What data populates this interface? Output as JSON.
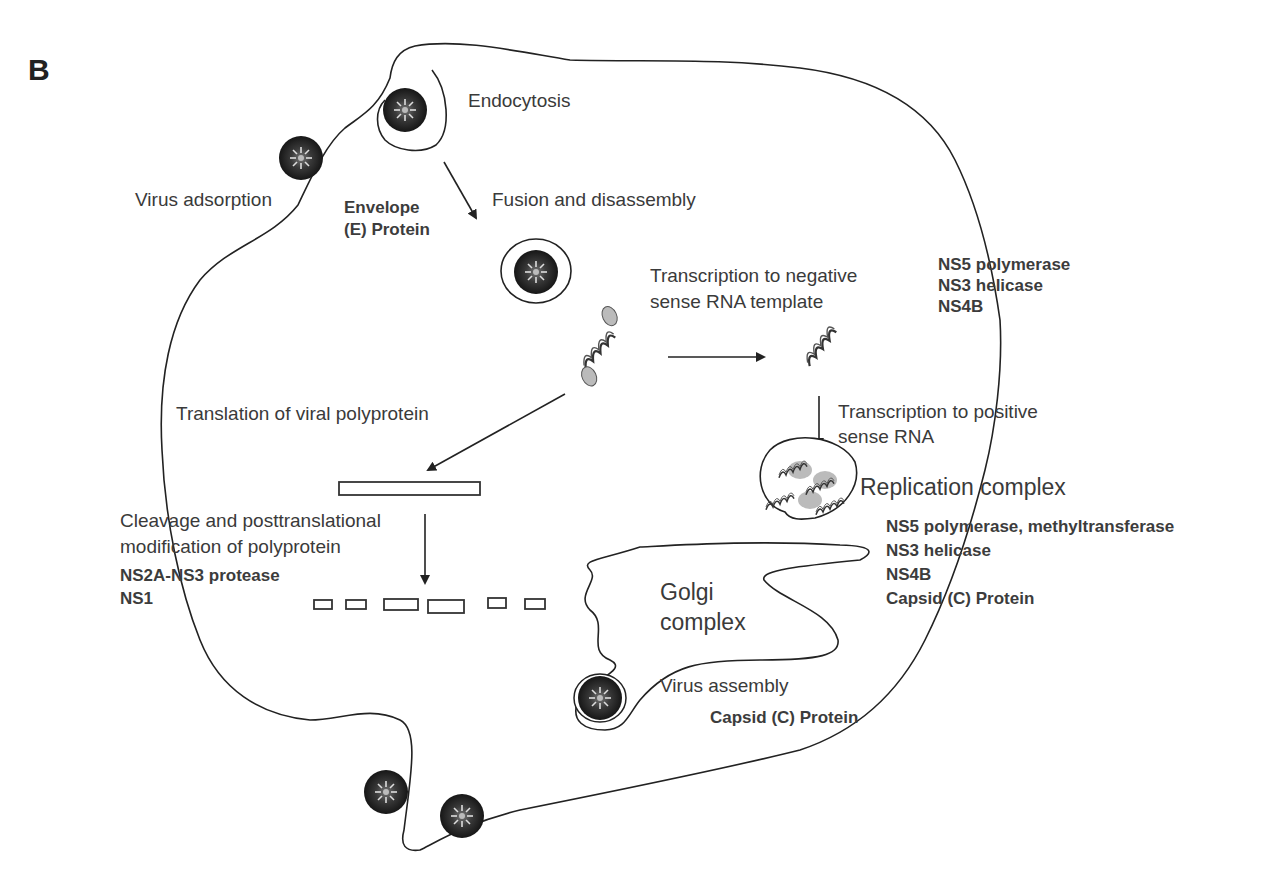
{
  "panel_label": "B",
  "steps": {
    "endocytosis": "Endocytosis",
    "virus_adsorption": "Virus adsorption",
    "fusion": "Fusion and disassembly",
    "neg_transcription": [
      "Transcription to negative",
      "sense RNA template"
    ],
    "translation": "Translation of viral polyprotein",
    "pos_transcription": [
      "Transcription to positive",
      "sense RNA"
    ],
    "replication_complex": "Replication complex",
    "cleavage": [
      "Cleavage and posttranslational",
      "modification of polyprotein"
    ],
    "golgi": [
      "Golgi",
      "complex"
    ],
    "virus_assembly": "Virus assembly"
  },
  "proteins": {
    "envelope": [
      "Envelope",
      "(E) Protein"
    ],
    "neg_transcription": [
      "NS5 polymerase",
      "NS3 helicase",
      "NS4B"
    ],
    "replication": [
      "NS5 polymerase, methyltransferase",
      "NS3 helicase",
      "NS4B",
      "Capsid (C) Protein"
    ],
    "cleavage": [
      "NS2A-NS3 protease",
      "NS1"
    ],
    "assembly": "Capsid (C) Protein"
  }
}
